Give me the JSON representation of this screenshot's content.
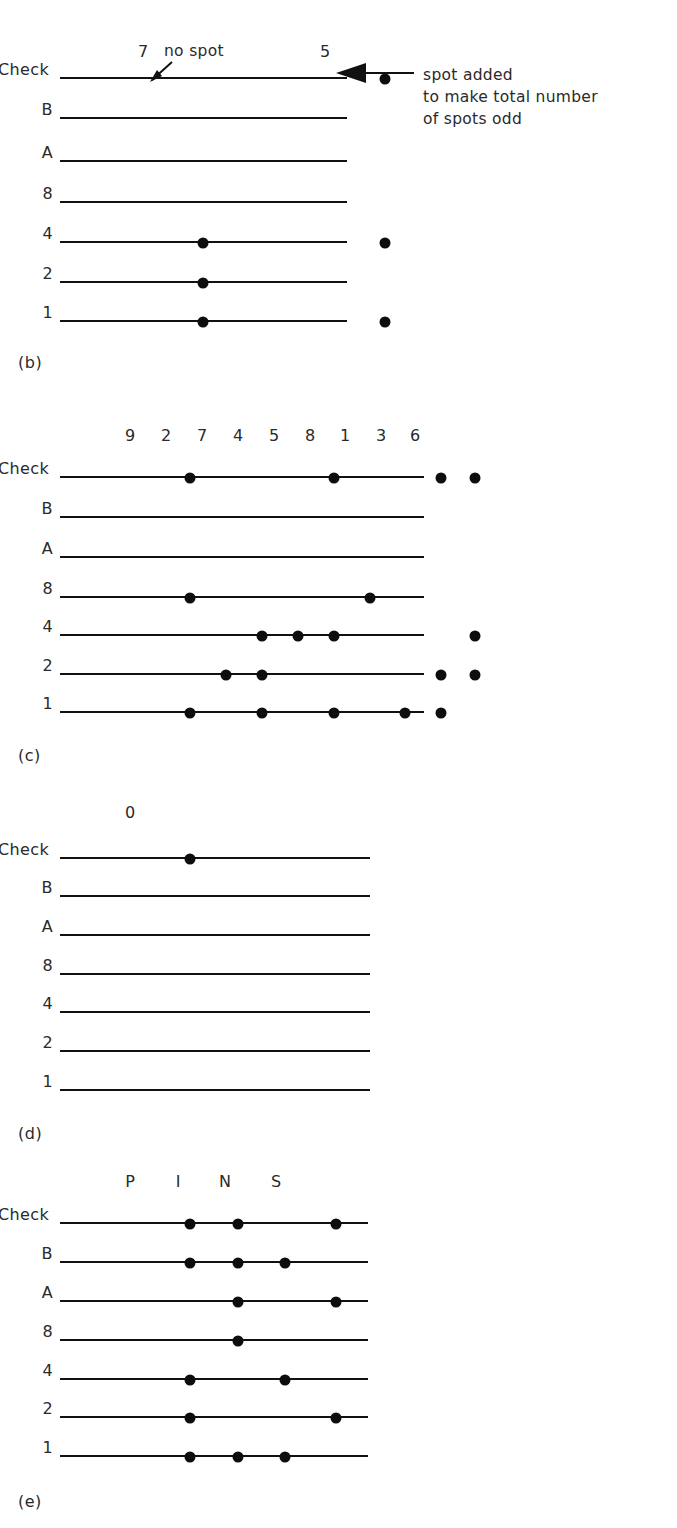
{
  "figure": {
    "row_labels": [
      "Check",
      "B",
      "A",
      "8",
      "4",
      "2",
      "1"
    ],
    "panels": [
      {
        "caption": "(b)",
        "column_headers": [
          {
            "label": "7",
            "x": 143
          },
          {
            "label": "5",
            "x": 325
          }
        ],
        "rows": [
          {
            "label": "Check",
            "spots": [
              325
            ]
          },
          {
            "label": "B",
            "spots": []
          },
          {
            "label": "A",
            "spots": []
          },
          {
            "label": "8",
            "spots": []
          },
          {
            "label": "4",
            "spots": [
              143,
              325
            ]
          },
          {
            "label": "2",
            "spots": [
              143
            ]
          },
          {
            "label": "1",
            "spots": [
              143,
              325
            ]
          }
        ],
        "annotation": {
          "inline_label": "no spot",
          "callout_lines": [
            "spot added",
            "to make total number",
            "of spots odd"
          ]
        }
      },
      {
        "caption": "(c)",
        "column_headers": [
          {
            "label": "9",
            "x": 130
          },
          {
            "label": "2",
            "x": 166
          },
          {
            "label": "7",
            "x": 202
          },
          {
            "label": "4",
            "x": 238
          },
          {
            "label": "5",
            "x": 274
          },
          {
            "label": "8",
            "x": 310
          },
          {
            "label": "1",
            "x": 345
          },
          {
            "label": "3",
            "x": 381
          },
          {
            "label": "6",
            "x": 415
          }
        ],
        "rows": [
          {
            "label": "Check",
            "spots": [
              130,
              274,
              381,
              415
            ]
          },
          {
            "label": "B",
            "spots": []
          },
          {
            "label": "A",
            "spots": []
          },
          {
            "label": "8",
            "spots": [
              130,
              310
            ]
          },
          {
            "label": "4",
            "spots": [
              202,
              238,
              274,
              415
            ]
          },
          {
            "label": "2",
            "spots": [
              166,
              202,
              381,
              415
            ]
          },
          {
            "label": "1",
            "spots": [
              130,
              202,
              274,
              345,
              381
            ]
          }
        ]
      },
      {
        "caption": "(d)",
        "column_headers": [
          {
            "label": "0",
            "x": 130
          }
        ],
        "rows": [
          {
            "label": "Check",
            "spots": [
              130
            ]
          },
          {
            "label": "B",
            "spots": []
          },
          {
            "label": "A",
            "spots": []
          },
          {
            "label": "8",
            "spots": []
          },
          {
            "label": "4",
            "spots": []
          },
          {
            "label": "2",
            "spots": []
          },
          {
            "label": "1",
            "spots": []
          }
        ]
      },
      {
        "caption": "(e)",
        "column_headers": [
          {
            "label": "P",
            "x": 130
          },
          {
            "label": "I",
            "x": 178
          },
          {
            "label": "N",
            "x": 225
          },
          {
            "label": "S",
            "x": 276
          }
        ],
        "rows": [
          {
            "label": "Check",
            "spots": [
              130,
              178,
              276
            ]
          },
          {
            "label": "B",
            "spots": [
              130,
              178,
              225
            ]
          },
          {
            "label": "A",
            "spots": [
              178,
              276
            ]
          },
          {
            "label": "8",
            "spots": [
              178
            ]
          },
          {
            "label": "4",
            "spots": [
              130,
              225
            ]
          },
          {
            "label": "2",
            "spots": [
              130,
              276
            ]
          },
          {
            "label": "1",
            "spots": [
              130,
              178,
              225
            ]
          }
        ]
      }
    ]
  }
}
